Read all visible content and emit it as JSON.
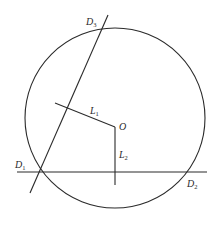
{
  "diagram": {
    "stroke_color": "#2a2a2a",
    "background": "#ffffff",
    "circle": {
      "cx": 115,
      "cy": 118,
      "r": 90
    },
    "center": {
      "label": "O",
      "x": 115,
      "y": 127
    },
    "points": [
      {
        "id": "D3",
        "label": "D",
        "sub": "3",
        "x": 101,
        "y": 31
      },
      {
        "id": "D1",
        "label": "D",
        "sub": "1",
        "x": 38,
        "y": 172
      },
      {
        "id": "D2",
        "label": "D",
        "sub": "2",
        "x": 190,
        "y": 172
      }
    ],
    "lines": [
      {
        "id": "line-D1D2",
        "x1": 17,
        "y1": 172,
        "x2": 207,
        "y2": 172
      },
      {
        "id": "line-D1D3",
        "x1": 108,
        "y1": 15,
        "x2": 30,
        "y2": 193
      }
    ],
    "segments": [
      {
        "id": "L1",
        "label": "L",
        "sub": "1",
        "x1": 55,
        "y1": 103,
        "x2": 115,
        "y2": 127
      },
      {
        "id": "L2",
        "label": "L",
        "sub": "2",
        "x1": 115,
        "y1": 127,
        "x2": 115,
        "y2": 185
      }
    ],
    "labels": {
      "D3": {
        "text": "D",
        "sub": "3",
        "x": 86,
        "y": 25
      },
      "D1": {
        "text": "D",
        "sub": "1",
        "x": 15,
        "y": 168
      },
      "D2": {
        "text": "D",
        "sub": "2",
        "x": 187,
        "y": 187
      },
      "L1": {
        "text": "L",
        "sub": "1",
        "x": 90,
        "y": 114
      },
      "O": {
        "text": "O",
        "x": 119,
        "y": 130
      },
      "L2": {
        "text": "L",
        "sub": "2",
        "x": 119,
        "y": 158
      }
    }
  }
}
